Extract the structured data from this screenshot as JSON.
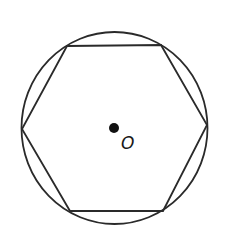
{
  "diagram": {
    "center_label": "O",
    "stroke_color": "#2a2a2a",
    "background": "#ffffff",
    "circle": {
      "cx": 114.5,
      "cy": 128,
      "rx": 93,
      "ry": 96
    },
    "center_point": {
      "x": 114,
      "y": 128,
      "r": 5
    },
    "hexagon_vertices": [
      {
        "name": "top-left",
        "x": 67,
        "y": 46
      },
      {
        "name": "top-right",
        "x": 161,
        "y": 45
      },
      {
        "name": "right",
        "x": 207,
        "y": 125
      },
      {
        "name": "bottom-right",
        "x": 163,
        "y": 211
      },
      {
        "name": "bottom-left",
        "x": 70,
        "y": 211
      },
      {
        "name": "left",
        "x": 22,
        "y": 129
      }
    ]
  }
}
